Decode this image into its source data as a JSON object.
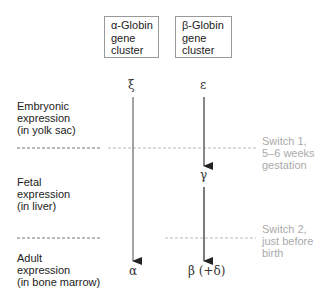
{
  "clusters": [
    {
      "lines": [
        "α-Globin",
        "gene",
        "cluster"
      ]
    },
    {
      "lines": [
        "β-Globin",
        "gene",
        "cluster"
      ]
    }
  ],
  "stages": [
    {
      "lines": [
        "Embryonic",
        "expression",
        "(in yolk sac)"
      ]
    },
    {
      "lines": [
        "Fetal",
        "expression",
        "(in liver)"
      ]
    },
    {
      "lines": [
        "Adult",
        "expression",
        "(in bone marrow)"
      ]
    }
  ],
  "genes": {
    "alpha_embryonic": "ξ",
    "beta_embryonic": "ε",
    "beta_fetal": "γ",
    "alpha_adult": "α",
    "beta_adult": "β (+δ)"
  },
  "switches": [
    {
      "lines": [
        "Switch 1,",
        "5–6 weeks",
        "gestation"
      ]
    },
    {
      "lines": [
        "Switch 2,",
        "just before",
        "birth"
      ]
    }
  ],
  "colors": {
    "dark_line": "#777777",
    "light_line": "#bbbbbb",
    "arrow": "#333333",
    "switch_text": "#aaaaaa"
  }
}
